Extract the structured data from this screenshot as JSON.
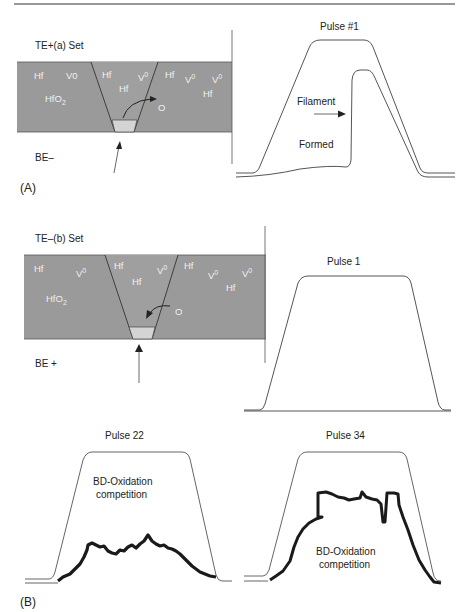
{
  "figure": {
    "panel_a": {
      "label": "(A)",
      "title": "TE+(a) Set",
      "bottom_electrode": "BE–",
      "oxide_label": "HfO",
      "oxide_subscript": "2",
      "species": [
        "Hf",
        "V0",
        "Hf",
        "Hf",
        "V0",
        "Hf",
        "V0",
        "V0",
        "Hf"
      ],
      "oxygen_label": "O",
      "slab_color": "#9a9a9a",
      "plug_color": "#d4d4d4",
      "pulse": {
        "title": "Pulse #1",
        "annotation_line1": "Filament",
        "annotation_line2": "Formed"
      }
    },
    "panel_b": {
      "label": "(B)",
      "title": "TE–(b) Set",
      "bottom_electrode": "BE +",
      "oxide_label": "HfO",
      "oxide_subscript": "2",
      "oxygen_label": "O",
      "pulses": [
        {
          "title": "Pulse 1"
        },
        {
          "title": "Pulse 22",
          "annotation_line1": "BD-Oxidation",
          "annotation_line2": "competition"
        },
        {
          "title": "Pulse 34",
          "annotation_line1": "BD-Oxidation",
          "annotation_line2": "competition"
        }
      ]
    },
    "superscript_zero": "0",
    "line_color": "#555555",
    "trace_color": "#1a1a1a"
  }
}
